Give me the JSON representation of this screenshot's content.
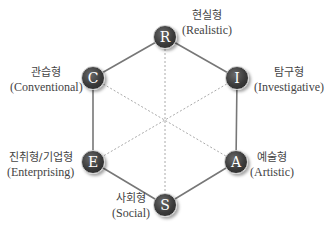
{
  "diagram": {
    "nodes": [
      {
        "letter": "R",
        "korean": "현실형",
        "english": "(Realistic)"
      },
      {
        "letter": "I",
        "korean": "탐구형",
        "english": "(Investigative)"
      },
      {
        "letter": "A",
        "korean": "예술형",
        "english": "(Artistic)"
      },
      {
        "letter": "S",
        "korean": "사회형",
        "english": "(Social)"
      },
      {
        "letter": "E",
        "korean": "진취형/기업형",
        "english": "(Enterprising)"
      },
      {
        "letter": "C",
        "korean": "관습형",
        "english": "(Conventional)"
      }
    ],
    "colors": {
      "node_fill": "#3a3a3a",
      "edge": "#777777",
      "diagonal": "#aaaaaa"
    }
  }
}
